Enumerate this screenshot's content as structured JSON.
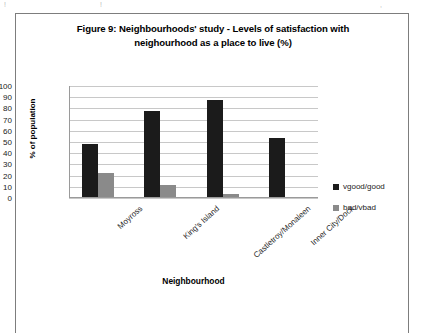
{
  "figure": {
    "title_line1": "Figure 9: Neighbourhoods' study - Levels of satisfaction with",
    "title_line2": "neighourhood as a place to live (%)"
  },
  "artifact": {
    "top_marks": "! !",
    "top_right_mark": ","
  },
  "chart_data": {
    "type": "bar",
    "title": "Figure 9: Neighbourhoods' study - Levels of satisfaction with neighourhood as a place to live (%)",
    "xlabel": "Neighbourhood",
    "ylabel": "% of population",
    "ylim": [
      0,
      100
    ],
    "ytick_step": 10,
    "yticks": [
      0,
      10,
      20,
      30,
      40,
      50,
      60,
      70,
      80,
      90,
      100
    ],
    "grid": true,
    "legend_position": "right",
    "categories": [
      "Moyross",
      "King's Island",
      "Castletroy/Monaleen",
      "Inner City/Dock"
    ],
    "series": [
      {
        "name": "vgood/good",
        "color": "#1b1b1b",
        "values": [
          47,
          77,
          86.5,
          53
        ]
      },
      {
        "name": "bad/vbad",
        "color": "#8a8a8a",
        "values": [
          21,
          10.5,
          3,
          0
        ]
      }
    ]
  }
}
